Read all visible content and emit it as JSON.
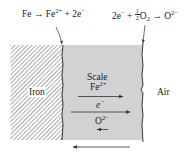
{
  "diagram": {
    "equations": {
      "anode": {
        "base": "Fe → Fe",
        "sup": "2+",
        "tail": " + 2e",
        "tail_sup": "−"
      },
      "cathode": {
        "lead": "2e",
        "lead_sup": "−",
        "plus": " + ",
        "frac_num": "1",
        "frac_den": "2",
        "o2": "O",
        "o2_sub": "2",
        "arrow": " → O",
        "product_sup": "2−"
      }
    },
    "regions": {
      "iron": {
        "label": "Iron",
        "fill": "hatched"
      },
      "scale": {
        "label": "Scale",
        "fill": "#d2d2d2"
      },
      "air": {
        "label": "Air"
      }
    },
    "species": {
      "fe_ion": {
        "base": "Fe",
        "sup": "2+",
        "direction": "right"
      },
      "electron": {
        "base": "e",
        "sup": "−",
        "direction": "right"
      },
      "oxide_ion": {
        "base": "O",
        "sup": "2−",
        "direction": "left"
      }
    },
    "bottom_arrow": {
      "direction": "left"
    },
    "colors": {
      "scale": "#d2d2d2",
      "hatch": "#555555",
      "line": "#222222"
    }
  }
}
